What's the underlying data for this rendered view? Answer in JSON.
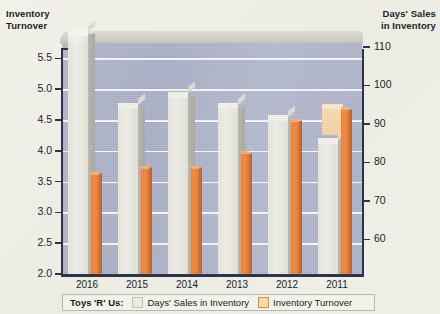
{
  "chart_data": {
    "type": "bar",
    "title": "",
    "company": "Toys 'R' Us:",
    "categories": [
      "2016",
      "2015",
      "2014",
      "2013",
      "2012",
      "2011"
    ],
    "left_axis": {
      "label": "Inventory Turnover",
      "ticks": [
        "5.5",
        "5.0",
        "4.5",
        "4.0",
        "3.5",
        "3.0",
        "2.5",
        "2.0"
      ],
      "ylim": [
        2.0,
        5.75
      ]
    },
    "right_axis": {
      "label": "Days' Sales in Inventory",
      "ticks": [
        "110",
        "100",
        "90",
        "80",
        "70",
        "60"
      ],
      "ylim": [
        51,
        111
      ]
    },
    "grid": true,
    "legend_position": "bottom",
    "series": [
      {
        "name": "Days' Sales in Inventory",
        "axis": "right",
        "color": "#ecebe2",
        "values": [
          113,
          94,
          97,
          94,
          91,
          85
        ]
      },
      {
        "name": "Inventory Turnover",
        "axis": "left",
        "color": "#ef8233",
        "values": [
          3.62,
          3.72,
          3.72,
          3.95,
          4.48,
          4.67
        ]
      }
    ]
  },
  "axes": {
    "left_title_line1": "Inventory",
    "left_title_line2": "Turnover",
    "right_title_line1": "Days' Sales",
    "right_title_line2": "in Inventory"
  },
  "legend": {
    "company": "Toys 'R' Us:",
    "items": [
      {
        "label": "Days' Sales in Inventory",
        "swatch": "gray"
      },
      {
        "label": "Inventory Turnover",
        "swatch": "orange"
      }
    ]
  }
}
